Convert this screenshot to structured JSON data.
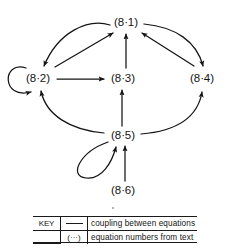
{
  "figure": {
    "type": "directed-graph"
  },
  "nodes": [
    {
      "id": "n1",
      "label": "(8·1)",
      "x": 126,
      "y": 22
    },
    {
      "id": "n2",
      "label": "(8·2)",
      "x": 38,
      "y": 78
    },
    {
      "id": "n3",
      "label": "(8·3)",
      "x": 122,
      "y": 78
    },
    {
      "id": "n4",
      "label": "(8·4)",
      "x": 202,
      "y": 78
    },
    {
      "id": "n5",
      "label": "(8·5)",
      "x": 122,
      "y": 135
    },
    {
      "id": "n6",
      "label": "(8·6)",
      "x": 122,
      "y": 190
    }
  ],
  "edges": [
    {
      "from": "(8·2)",
      "to": "(8·1)",
      "style": "straight"
    },
    {
      "from": "(8·1)",
      "to": "(8·2)",
      "style": "curved"
    },
    {
      "from": "(8·4)",
      "to": "(8·1)",
      "style": "straight"
    },
    {
      "from": "(8·1)",
      "to": "(8·4)",
      "style": "curved"
    },
    {
      "from": "(8·2)",
      "to": "(8·3)",
      "style": "straight"
    },
    {
      "from": "(8·3)",
      "to": "(8·1)",
      "style": "straight"
    },
    {
      "from": "(8·5)",
      "to": "(8·3)",
      "style": "straight"
    },
    {
      "from": "(8·5)",
      "to": "(8·2)",
      "style": "curved"
    },
    {
      "from": "(8·5)",
      "to": "(8·4)",
      "style": "curved"
    },
    {
      "from": "(8·6)",
      "to": "(8·5)",
      "style": "straight"
    },
    {
      "from": "(8·2)",
      "to": "(8·2)",
      "style": "self-loop"
    },
    {
      "from": "(8·5)",
      "to": "(8·5)",
      "style": "self-loop"
    }
  ],
  "key": {
    "title": "KEY",
    "row1": {
      "symbol": "line-sample",
      "text": "coupling  between  equations"
    },
    "row2": {
      "symbol": "(···)",
      "text": "equation  numbers  from  text"
    }
  },
  "colors": {
    "ink": "#141414",
    "rule": "#1a1a1a",
    "background": "#ffffff"
  }
}
